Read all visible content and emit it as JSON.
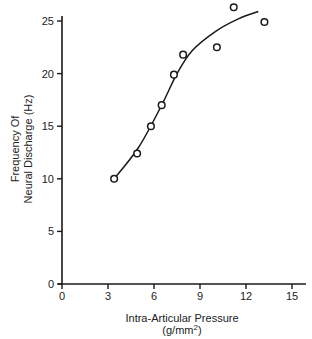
{
  "chart_data": {
    "type": "scatter",
    "title": "",
    "xlabel": "Intra-Articular Pressure",
    "xlabel_units": "(g/mm2)",
    "ylabel_line1": "Frequency Of",
    "ylabel_line2": "Neural Discharge (Hz)",
    "xlim": [
      0,
      15
    ],
    "ylim": [
      0,
      25
    ],
    "xticks": [
      0,
      3,
      6,
      9,
      12,
      15
    ],
    "yticks": [
      0,
      5,
      10,
      15,
      20,
      25
    ],
    "grid": false,
    "legend": null,
    "series": [
      {
        "name": "observed",
        "marker": "open-circle",
        "points": [
          {
            "x": 3.4,
            "y": 10.0
          },
          {
            "x": 4.9,
            "y": 12.4
          },
          {
            "x": 5.8,
            "y": 15.0
          },
          {
            "x": 6.5,
            "y": 17.0
          },
          {
            "x": 7.3,
            "y": 19.9
          },
          {
            "x": 7.9,
            "y": 21.8
          },
          {
            "x": 10.1,
            "y": 22.5
          },
          {
            "x": 11.2,
            "y": 26.3
          },
          {
            "x": 13.2,
            "y": 24.9
          }
        ]
      },
      {
        "name": "fitted curve",
        "marker": "line",
        "points": [
          {
            "x": 3.4,
            "y": 10.0
          },
          {
            "x": 5.0,
            "y": 13.0
          },
          {
            "x": 6.5,
            "y": 17.0
          },
          {
            "x": 7.5,
            "y": 20.0
          },
          {
            "x": 8.5,
            "y": 22.2
          },
          {
            "x": 10.0,
            "y": 24.0
          },
          {
            "x": 11.5,
            "y": 25.2
          },
          {
            "x": 12.8,
            "y": 25.9
          }
        ]
      }
    ]
  },
  "axes": {
    "x_label": "Intra-Articular Pressure",
    "x_units_prefix": "(g/mm",
    "x_units_sup": "2",
    "x_units_suffix": ")",
    "y_label_line1": "Frequency Of",
    "y_label_line2": "Neural Discharge (Hz)",
    "x_ticks": [
      "0",
      "3",
      "6",
      "9",
      "12",
      "15"
    ],
    "y_ticks": [
      "0",
      "5",
      "10",
      "15",
      "20",
      "25"
    ]
  }
}
